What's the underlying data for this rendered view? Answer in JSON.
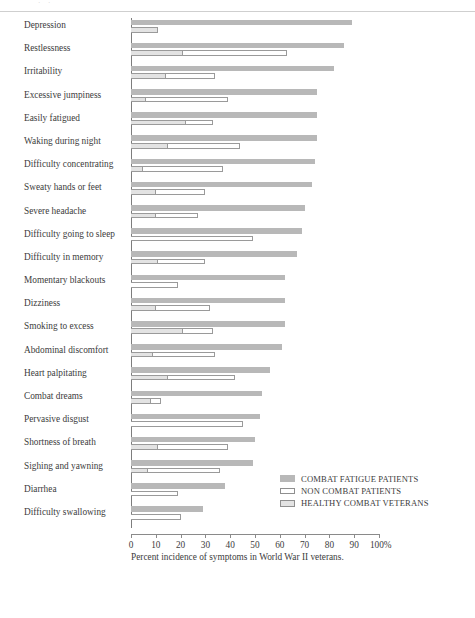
{
  "page": {
    "top_crop_text": "· ·",
    "caption": "Percent incidence of symptoms in World War II veterans."
  },
  "legend": {
    "position": "inside-lower-right",
    "items": [
      {
        "key": "s1",
        "label": "COMBAT FATIGUE PATIENTS",
        "color": "#b8b8b8",
        "style": "filled"
      },
      {
        "key": "s2",
        "label": "NON COMBAT PATIENTS",
        "color": "#ffffff",
        "style": "outline"
      },
      {
        "key": "s3",
        "label": "HEALTHY COMBAT VETERANS",
        "color": "#e3e3e3",
        "style": "light-fill"
      }
    ]
  },
  "axis": {
    "ticks": [
      "0",
      "10",
      "20",
      "30",
      "40",
      "50",
      "60",
      "70",
      "80",
      "90",
      "100%"
    ],
    "values": [
      0,
      10,
      20,
      30,
      40,
      50,
      60,
      70,
      80,
      90,
      100
    ],
    "min": 0,
    "max": 100
  },
  "chart_data": {
    "type": "bar",
    "orientation": "horizontal",
    "title": "",
    "subtitle": "",
    "xlabel": "Percent incidence of symptoms in World War II veterans.",
    "ylabel": "",
    "xlim": [
      0,
      100
    ],
    "grid": false,
    "legend_position": "lower right",
    "categories": [
      "Depression",
      "Restlessness",
      "Irritability",
      "Excessive jumpiness",
      "Easily fatigued",
      "Waking during night",
      "Difficulty concentrating",
      "Sweaty hands or feet",
      "Severe headache",
      "Difficulty going to sleep",
      "Difficulty in memory",
      "Momentary blackouts",
      "Dizziness",
      "Smoking to excess",
      "Abdominal discomfort",
      "Heart palpitating",
      "Combat dreams",
      "Pervasive disgust",
      "Shortness of breath",
      "Sighing and yawning",
      "Diarrhea",
      "Difficulty swallowing"
    ],
    "series": [
      {
        "name": "COMBAT FATIGUE PATIENTS",
        "color": "#b8b8b8",
        "values": [
          89,
          86,
          82,
          75,
          75,
          75,
          74,
          73,
          70,
          69,
          67,
          62,
          62,
          62,
          61,
          56,
          53,
          52,
          50,
          49,
          38,
          29
        ]
      },
      {
        "name": "NON COMBAT PATIENTS",
        "color": "#ffffff",
        "values": [
          11,
          63,
          34,
          39,
          33,
          44,
          37,
          30,
          27,
          49,
          30,
          19,
          32,
          33,
          34,
          42,
          12,
          45,
          39,
          36,
          19,
          20
        ]
      },
      {
        "name": "HEALTHY COMBAT VETERANS",
        "color": "#e3e3e3",
        "values": [
          11,
          21,
          14,
          6,
          22,
          15,
          5,
          10,
          10,
          0,
          11,
          0,
          10,
          21,
          9,
          15,
          8,
          0,
          11,
          7,
          0,
          0
        ]
      }
    ]
  }
}
